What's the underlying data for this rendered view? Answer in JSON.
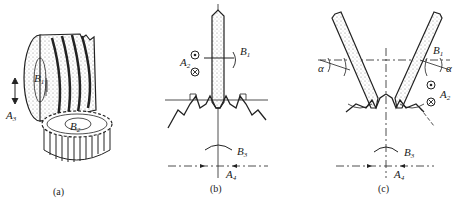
{
  "figure": {
    "panels": [
      {
        "id": "a",
        "caption": "(a)",
        "labels": {
          "B1": "B",
          "B1_sub": "1",
          "B2": "B",
          "B2_sub": "2",
          "A3": "A",
          "A3_sub": "3"
        }
      },
      {
        "id": "b",
        "caption": "(b)",
        "labels": {
          "A2": "A",
          "A2_sub": "2",
          "B1": "B",
          "B1_sub": "1",
          "B3": "B",
          "B3_sub": "3",
          "A4": "A",
          "A4_sub": "4"
        }
      },
      {
        "id": "c",
        "caption": "(c)",
        "labels": {
          "alpha_left": "α",
          "alpha_right": "α",
          "B1": "B",
          "B1_sub": "1",
          "A2": "A",
          "A2_sub": "2",
          "B3": "B",
          "B3_sub": "3",
          "A4": "A",
          "A4_sub": "4"
        }
      }
    ]
  },
  "colors": {
    "ink": "#222222",
    "background": "#ffffff",
    "stipple": "#888888"
  }
}
